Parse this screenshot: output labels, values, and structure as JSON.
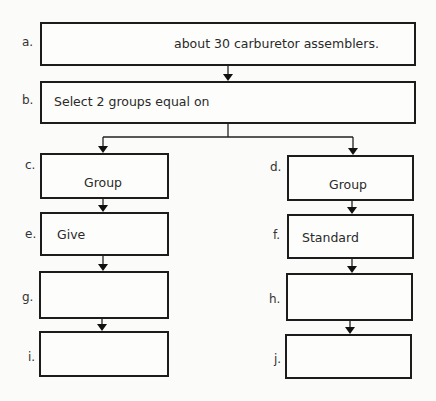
{
  "diagram": {
    "boxes": {
      "a": {
        "label": "a.",
        "text": "about 30 carburetor assemblers."
      },
      "b": {
        "label": "b.",
        "text": "Select 2 groups equal on"
      },
      "c": {
        "label": "c.",
        "text": "Group"
      },
      "d": {
        "label": "d.",
        "text": "Group"
      },
      "e": {
        "label": "e.",
        "text": "Give"
      },
      "f": {
        "label": "f.",
        "text": "Standard"
      },
      "g": {
        "label": "g.",
        "text": ""
      },
      "h": {
        "label": "h.",
        "text": ""
      },
      "i": {
        "label": "i.",
        "text": ""
      },
      "j": {
        "label": "j.",
        "text": ""
      }
    },
    "edges": [
      [
        "a",
        "b"
      ],
      [
        "b",
        "c"
      ],
      [
        "b",
        "d"
      ],
      [
        "c",
        "e"
      ],
      [
        "e",
        "g"
      ],
      [
        "g",
        "i"
      ],
      [
        "d",
        "f"
      ],
      [
        "f",
        "h"
      ],
      [
        "h",
        "j"
      ]
    ]
  }
}
